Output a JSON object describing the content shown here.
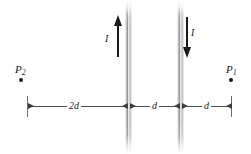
{
  "figure": {
    "background_color": "#ffffff",
    "wires": [
      {
        "id": "left-wire",
        "current_label": "I",
        "current_direction": "up",
        "x_px": 128,
        "color": "#8e8e8e"
      },
      {
        "id": "right-wire",
        "current_label": "I",
        "current_direction": "down",
        "x_px": 180,
        "color": "#8e8e8e"
      }
    ],
    "points": [
      {
        "id": "point-p2",
        "label_base": "P",
        "label_sub": "2",
        "x_px": 24,
        "side": "left"
      },
      {
        "id": "point-p1",
        "label_base": "P",
        "label_sub": "1",
        "x_px": 231,
        "side": "right"
      }
    ],
    "dimensions": [
      {
        "id": "dim-2d",
        "label": "2d",
        "from": "point-p2",
        "to": "left-wire"
      },
      {
        "id": "dim-d-middle",
        "label": "d",
        "from": "left-wire",
        "to": "right-wire"
      },
      {
        "id": "dim-d-right",
        "label": "d",
        "from": "right-wire",
        "to": "point-p1"
      }
    ],
    "colors": {
      "ink": "#151515",
      "rule": "#4d4d4d",
      "wire_shade": "#8e8e8e"
    }
  }
}
